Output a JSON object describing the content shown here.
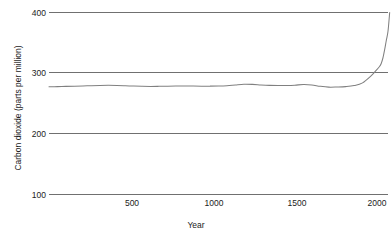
{
  "chart_data": {
    "type": "line",
    "title": "",
    "xlabel": "Year",
    "ylabel": "Carbon dioxide (parts per million)",
    "xlim": [
      0,
      2000
    ],
    "ylim": [
      100,
      400
    ],
    "grid": true,
    "legend": null,
    "xticks": [
      500,
      1000,
      1500,
      2000
    ],
    "xtick_labels": [
      "500",
      "1000",
      "1500",
      "2000"
    ],
    "yticks": [
      100,
      200,
      300,
      400
    ],
    "ytick_labels": [
      "100",
      "200",
      "300",
      "400"
    ],
    "line_color": "#808080",
    "grid_color": "#707070",
    "series": [
      {
        "name": "Atmospheric CO2",
        "x": [
          0,
          50,
          100,
          150,
          200,
          250,
          300,
          350,
          400,
          450,
          500,
          550,
          600,
          650,
          700,
          750,
          800,
          850,
          900,
          950,
          1000,
          1050,
          1100,
          1150,
          1200,
          1250,
          1300,
          1350,
          1400,
          1450,
          1500,
          1550,
          1600,
          1650,
          1700,
          1750,
          1800,
          1850,
          1900,
          1925,
          1950,
          1960,
          1970,
          1980,
          1990,
          2000,
          2010
        ],
        "values": [
          277.5,
          277.8,
          278.2,
          278.6,
          279.0,
          279.4,
          279.8,
          280.0,
          279.8,
          279.3,
          278.7,
          278.3,
          278.1,
          278.3,
          278.6,
          278.9,
          279.0,
          278.8,
          278.6,
          278.6,
          278.8,
          279.4,
          280.6,
          281.7,
          281.5,
          280.6,
          279.9,
          279.6,
          279.7,
          280.2,
          281.3,
          280.6,
          278.4,
          277.0,
          277.2,
          277.8,
          279.5,
          284.0,
          295.5,
          303.0,
          311.0,
          316.0,
          325.0,
          338.5,
          354.0,
          369.0,
          400.0
        ]
      }
    ],
    "annotations": []
  },
  "axes": {
    "y_title": "Carbon dioxide (parts per million)",
    "x_title": "Year",
    "y_tick_labels": [
      "400",
      "300",
      "200",
      "100"
    ],
    "x_tick_labels": [
      "500",
      "1000",
      "1500",
      "2000"
    ]
  }
}
